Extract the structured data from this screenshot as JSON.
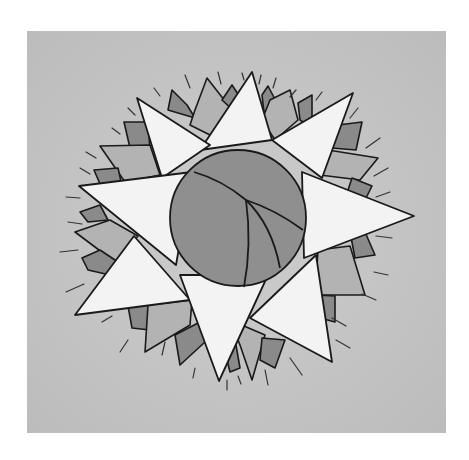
{
  "image": {
    "subject": "hand-drawn sun mandala with eight-pointed white star over layered gray rays and a central shaded circle",
    "colors": {
      "page": "#ffffff",
      "panel": "#c4c4c4",
      "ray_light": "#b3b3b3",
      "ray_dark": "#8a8a8a",
      "star": "#f3f3f3",
      "circle": "#8f8f8f",
      "ink": "#1a1a1a"
    }
  }
}
